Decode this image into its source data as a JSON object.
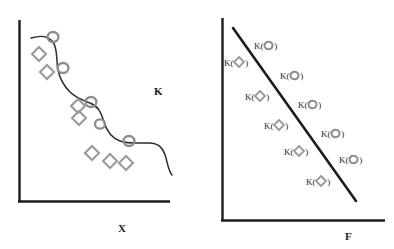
{
  "figure": {
    "type": "diagram",
    "background_color": "#ffffff",
    "marker_color": "#8d8d8d",
    "line_color": "#1c1c1c",
    "axis_color": "#1c1c1c",
    "text_color": "#2a2a2a"
  },
  "left_panel": {
    "name": "staircase-scatter-panel",
    "x_axis_label": "X",
    "y_axis_label": "K",
    "curve_description": "descending staircase / step-shaped smooth curve",
    "axes": {
      "y_axis": {
        "x": 19,
        "y_top": 20,
        "y_bottom": 202
      },
      "x_axis": {
        "y": 202,
        "x_left": 19,
        "x_right": 170
      }
    },
    "circle_markers": [
      {
        "cx": 53,
        "cy": 37
      },
      {
        "cx": 63,
        "cy": 68
      },
      {
        "cx": 91,
        "cy": 102
      },
      {
        "cx": 100,
        "cy": 124
      },
      {
        "cx": 129,
        "cy": 141
      }
    ],
    "diamond_markers": [
      {
        "cx": 39,
        "cy": 54
      },
      {
        "cx": 47,
        "cy": 72
      },
      {
        "cx": 78,
        "cy": 106
      },
      {
        "cx": 79,
        "cy": 118
      },
      {
        "cx": 92,
        "cy": 153
      },
      {
        "cx": 110,
        "cy": 161
      },
      {
        "cx": 126,
        "cy": 163
      }
    ]
  },
  "right_panel": {
    "name": "linear-fit-panel",
    "x_axis_label": "F",
    "line_description": "straight descending line",
    "axes": {
      "y_axis": {
        "x": 222,
        "y_top": 18,
        "y_bottom": 221
      },
      "x_axis": {
        "y": 221,
        "x_left": 222,
        "x_right": 385
      }
    },
    "fit_line": {
      "x1": 233,
      "y1": 28,
      "x2": 356,
      "y2": 201
    },
    "point_labels": [
      {
        "text": "K(",
        "symbol": "circle",
        "close": ")",
        "x": 254,
        "y": 40,
        "name": "k-circle-label-1"
      },
      {
        "text": "K(",
        "symbol": "diamond",
        "close": ")",
        "x": 224,
        "y": 56,
        "name": "k-diamond-label-1"
      },
      {
        "text": "K(",
        "symbol": "circle",
        "close": ")",
        "x": 280,
        "y": 70,
        "name": "k-circle-label-2"
      },
      {
        "text": "K(",
        "symbol": "diamond",
        "close": ")",
        "x": 245,
        "y": 90,
        "name": "k-diamond-label-2"
      },
      {
        "text": "K(",
        "symbol": "circle",
        "close": ")",
        "x": 298,
        "y": 99,
        "name": "k-circle-label-3"
      },
      {
        "text": "K(",
        "symbol": "diamond",
        "close": ")",
        "x": 264,
        "y": 119,
        "name": "k-diamond-label-3"
      },
      {
        "text": "K(",
        "symbol": "circle",
        "close": ")",
        "x": 321,
        "y": 128,
        "name": "k-circle-label-4"
      },
      {
        "text": "K(",
        "symbol": "diamond",
        "close": ")",
        "x": 284,
        "y": 145,
        "name": "k-diamond-label-4"
      },
      {
        "text": "K(",
        "symbol": "circle",
        "close": ")",
        "x": 339,
        "y": 154,
        "name": "k-circle-label-5"
      },
      {
        "text": "K(",
        "symbol": "diamond",
        "close": ")",
        "x": 306,
        "y": 175,
        "name": "k-diamond-label-5"
      }
    ]
  }
}
